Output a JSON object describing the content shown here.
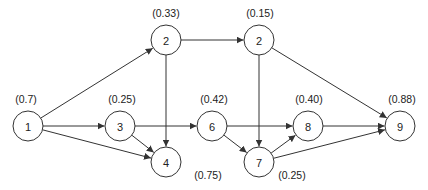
{
  "diagram": {
    "type": "directed-network",
    "node_radius": 15,
    "colors": {
      "stroke": "#333333",
      "fill": "#ffffff",
      "text": "#222222"
    },
    "nodes": [
      {
        "id": "n1",
        "label": "1",
        "prob": "(0.7)",
        "x": 28,
        "y": 126,
        "px": 26,
        "py": 103
      },
      {
        "id": "n2a",
        "label": "2",
        "prob": "(0.33)",
        "x": 166,
        "y": 40,
        "px": 166,
        "py": 17
      },
      {
        "id": "n3",
        "label": "3",
        "prob": "(0.25)",
        "x": 120,
        "y": 126,
        "px": 122,
        "py": 103
      },
      {
        "id": "n2b",
        "label": "2",
        "prob": "(0.15)",
        "x": 259,
        "y": 40,
        "px": 260,
        "py": 17
      },
      {
        "id": "n6",
        "label": "6",
        "prob": "(0.42)",
        "x": 212,
        "y": 126,
        "px": 214,
        "py": 103
      },
      {
        "id": "n8",
        "label": "8",
        "prob": "(0.40)",
        "x": 308,
        "y": 126,
        "px": 309,
        "py": 103
      },
      {
        "id": "n9",
        "label": "9",
        "prob": "(0.88)",
        "x": 400,
        "y": 126,
        "px": 402,
        "py": 103
      },
      {
        "id": "n4",
        "label": "4",
        "prob": "(0.75)",
        "x": 166,
        "y": 162,
        "px": 208,
        "py": 179
      },
      {
        "id": "n7",
        "label": "7",
        "prob": "(0.25)",
        "x": 259,
        "y": 162,
        "px": 292,
        "py": 179
      }
    ],
    "edges": [
      {
        "from": "n1",
        "to": "n2a"
      },
      {
        "from": "n1",
        "to": "n3"
      },
      {
        "from": "n1",
        "to": "n4"
      },
      {
        "from": "n2a",
        "to": "n2b"
      },
      {
        "from": "n2a",
        "to": "n4"
      },
      {
        "from": "n3",
        "to": "n6"
      },
      {
        "from": "n3",
        "to": "n4"
      },
      {
        "from": "n2b",
        "to": "n9"
      },
      {
        "from": "n2b",
        "to": "n7"
      },
      {
        "from": "n6",
        "to": "n8"
      },
      {
        "from": "n6",
        "to": "n7"
      },
      {
        "from": "n7",
        "to": "n8"
      },
      {
        "from": "n7",
        "to": "n9"
      },
      {
        "from": "n8",
        "to": "n9"
      }
    ]
  }
}
